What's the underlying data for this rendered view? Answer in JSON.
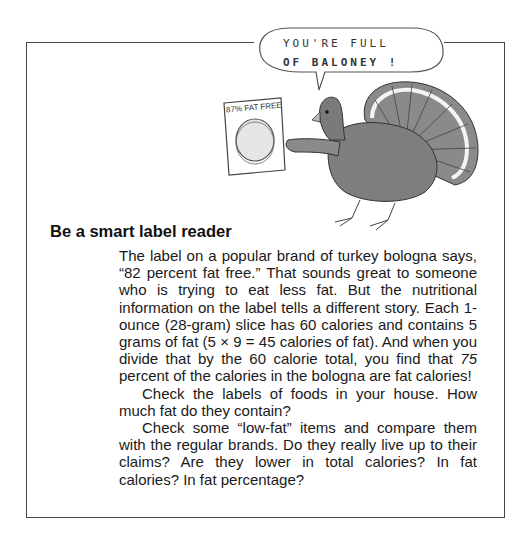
{
  "cartoon": {
    "speech_bubble_line1": "YOU'RE FULL",
    "speech_bubble_line2": "OF BALONEY !",
    "package_label": "87% FAT FREE"
  },
  "article": {
    "heading": "Be a smart label reader",
    "paragraphs": [
      {
        "before": "The label on a popular brand of turkey bologna says, “82 percent fat free.” That sounds great to someone who is trying to eat less fat. But the nutritional information on the label tells a different story. Each 1-ounce (28-gram) slice has 60 calories and contains 5 grams of fat (5 × 9 = 45 calories of fat). And when you divide that by the 60 calorie total, you find that ",
        "emphasis": "75",
        "after": " percent of the calories in the bologna are fat calories!"
      },
      {
        "text": "Check the labels of foods in your house. How much fat do they contain?"
      },
      {
        "text": "Check some “low-fat” items and compare them with the regular brands. Do they really live up to their claims? Are they lower in total calories? In fat calories? In fat percentage?"
      }
    ]
  }
}
